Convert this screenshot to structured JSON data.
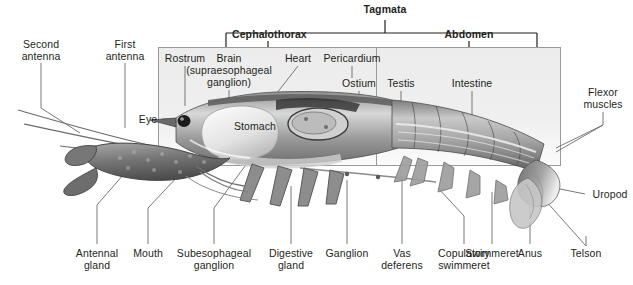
{
  "diagram": {
    "title": "Tagmata",
    "tagmata": {
      "root_label": "Tagmata",
      "divisions": [
        {
          "label": "Cephalothorax",
          "id": "cephalothorax"
        },
        {
          "label": "Abdomen",
          "id": "abdomen"
        }
      ]
    },
    "colors": {
      "box_fill": "#ebebeb",
      "box_stroke": "#8c8c8c",
      "leader_line": "#555555",
      "text": "#231f20",
      "bracket": "#231f20"
    },
    "labels": [
      {
        "id": "second-antenna",
        "text": "Second\nantenna",
        "x": 10,
        "y": 38,
        "w": 62
      },
      {
        "id": "first-antenna",
        "text": "First\nantenna",
        "x": 98,
        "y": 38,
        "w": 54
      },
      {
        "id": "rostrum",
        "text": "Rostrum",
        "x": 160,
        "y": 52,
        "w": 50
      },
      {
        "id": "brain",
        "text": "Brain\n(supraesophageal\nganglion)",
        "x": 183,
        "y": 52,
        "w": 92
      },
      {
        "id": "heart",
        "text": "Heart",
        "x": 281,
        "y": 52,
        "w": 34
      },
      {
        "id": "pericardium",
        "text": "Pericardium",
        "x": 317,
        "y": 52,
        "w": 70
      },
      {
        "id": "ostium",
        "text": "Ostium",
        "x": 337,
        "y": 77,
        "w": 44
      },
      {
        "id": "testis",
        "text": "Testis",
        "x": 383,
        "y": 77,
        "w": 36
      },
      {
        "id": "intestine",
        "text": "Intestine",
        "x": 447,
        "y": 77,
        "w": 50
      },
      {
        "id": "eye",
        "text": "Eye",
        "x": 136,
        "y": 113,
        "w": 24
      },
      {
        "id": "stomach",
        "text": "Stomach",
        "x": 229,
        "y": 120,
        "w": 52
      },
      {
        "id": "flexor-muscles",
        "text": "Flexor\nmuscles",
        "x": 578,
        "y": 86,
        "w": 50
      },
      {
        "id": "uropod",
        "text": "Uropod",
        "x": 588,
        "y": 188,
        "w": 44
      },
      {
        "id": "telson",
        "text": "Telson",
        "x": 565,
        "y": 247,
        "w": 42
      },
      {
        "id": "antennal-gland",
        "text": "Antennal\ngland",
        "x": 69,
        "y": 247,
        "w": 56
      },
      {
        "id": "mouth",
        "text": "Mouth",
        "x": 128,
        "y": 247,
        "w": 40
      },
      {
        "id": "subesophageal-ganglion",
        "text": "Subesophageal\nganglion",
        "x": 170,
        "y": 247,
        "w": 88
      },
      {
        "id": "digestive-gland",
        "text": "Digestive\ngland",
        "x": 263,
        "y": 247,
        "w": 56
      },
      {
        "id": "ganglion",
        "text": "Ganglion",
        "x": 321,
        "y": 247,
        "w": 52
      },
      {
        "id": "vas-deferens",
        "text": "Vas\ndeferens",
        "x": 375,
        "y": 247,
        "w": 54
      },
      {
        "id": "copulatory-swimmeret",
        "text": "Copulatory\nswimmeret",
        "x": 430,
        "y": 247,
        "w": 68
      },
      {
        "id": "swimmeret",
        "text": "Swimmeret",
        "x": 461,
        "y": 247,
        "w": 62
      },
      {
        "id": "anus",
        "text": "Anus",
        "x": 514,
        "y": 247,
        "w": 32
      }
    ]
  }
}
